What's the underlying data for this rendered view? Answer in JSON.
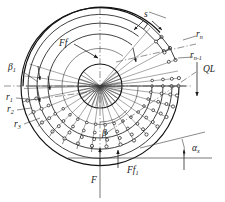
{
  "figure": {
    "background_color": "#ffffff",
    "line_color": "#1a1a1a",
    "width": 225,
    "height": 202
  },
  "labels": {
    "s": {
      "text": "s",
      "x": 147,
      "y": 16
    },
    "r_n": {
      "text": "r",
      "sub": "n",
      "x": 199,
      "y": 36
    },
    "r_n_minus_1": {
      "text": "r",
      "sub": "n-1",
      "x": 196,
      "y": 57
    },
    "QL": {
      "text": "QL",
      "x": 203,
      "y": 72
    },
    "Ff": {
      "text": "Ff",
      "x": 62,
      "y": 45
    },
    "beta_1": {
      "text": "β",
      "sub": "1",
      "x": 10,
      "y": 68
    },
    "r_1": {
      "text": "r",
      "sub": "1",
      "x": 8,
      "y": 99
    },
    "r_2": {
      "text": "r",
      "sub": "2",
      "x": 9,
      "y": 111
    },
    "r_3": {
      "text": "r",
      "sub": "3",
      "x": 16,
      "y": 126
    },
    "beta": {
      "text": "β",
      "x": 104,
      "y": 134
    },
    "alpha_x": {
      "text": "α",
      "sub": "x",
      "x": 196,
      "y": 150
    },
    "Ff_1": {
      "text": "Ff",
      "sub": "1",
      "x": 131,
      "y": 172
    },
    "F": {
      "text": "F",
      "x": 94,
      "y": 181
    }
  },
  "geometry": {
    "hub": {
      "cx": 100,
      "cy": 86,
      "r": 22
    },
    "outer_circle": {
      "cx": 100,
      "cy": 86,
      "r": 79
    },
    "arc_radii": [
      38,
      52,
      63,
      72,
      79
    ],
    "spoke_count": 34,
    "cell_node_color": "#ffffff"
  },
  "annotations": {
    "force_arrows": [
      "Ff",
      "F",
      "Ff1",
      "QL"
    ],
    "dimension": "s",
    "angles": [
      "beta",
      "beta_1",
      "alpha_x"
    ],
    "radii": [
      "r1",
      "r2",
      "r3",
      "rn-1",
      "rn"
    ]
  }
}
